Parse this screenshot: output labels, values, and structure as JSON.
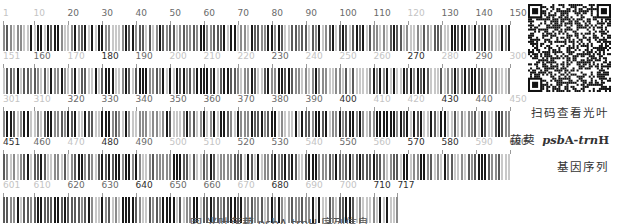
{
  "figure": {
    "sequence_length": 717,
    "rows": [
      {
        "start": 1,
        "end": 150,
        "labels": [
          {
            "t": "1",
            "tone": "l",
            "p": 0
          },
          {
            "t": "10",
            "tone": "l",
            "p": 9
          },
          {
            "t": "20",
            "tone": "m",
            "p": 19
          },
          {
            "t": "30",
            "tone": "m",
            "p": 29
          },
          {
            "t": "40",
            "tone": "m",
            "p": 39
          },
          {
            "t": "50",
            "tone": "m",
            "p": 49
          },
          {
            "t": "60",
            "tone": "m",
            "p": 59
          },
          {
            "t": "70",
            "tone": "m",
            "p": 69
          },
          {
            "t": "80",
            "tone": "m",
            "p": 79
          },
          {
            "t": "90",
            "tone": "m",
            "p": 89
          },
          {
            "t": "100",
            "tone": "m",
            "p": 99
          },
          {
            "t": "110",
            "tone": "m",
            "p": 109
          },
          {
            "t": "120",
            "tone": "l",
            "p": 119
          },
          {
            "t": "130",
            "tone": "m",
            "p": 129
          },
          {
            "t": "140",
            "tone": "m",
            "p": 139
          },
          {
            "t": "150",
            "tone": "m",
            "p": 149
          }
        ]
      },
      {
        "start": 151,
        "end": 300,
        "labels": [
          {
            "t": "151",
            "tone": "l",
            "p": 0
          },
          {
            "t": "160",
            "tone": "m",
            "p": 9
          },
          {
            "t": "170",
            "tone": "l",
            "p": 19
          },
          {
            "t": "180",
            "tone": "d",
            "p": 29
          },
          {
            "t": "190",
            "tone": "m",
            "p": 39
          },
          {
            "t": "200",
            "tone": "l",
            "p": 49
          },
          {
            "t": "210",
            "tone": "l",
            "p": 59
          },
          {
            "t": "220",
            "tone": "l",
            "p": 69
          },
          {
            "t": "230",
            "tone": "m",
            "p": 79
          },
          {
            "t": "240",
            "tone": "l",
            "p": 89
          },
          {
            "t": "250",
            "tone": "l",
            "p": 99
          },
          {
            "t": "260",
            "tone": "l",
            "p": 109
          },
          {
            "t": "270",
            "tone": "d",
            "p": 119
          },
          {
            "t": "280",
            "tone": "l",
            "p": 129
          },
          {
            "t": "290",
            "tone": "m",
            "p": 139
          },
          {
            "t": "300",
            "tone": "l",
            "p": 149
          }
        ]
      },
      {
        "start": 301,
        "end": 450,
        "labels": [
          {
            "t": "301",
            "tone": "l",
            "p": 0
          },
          {
            "t": "310",
            "tone": "l",
            "p": 9
          },
          {
            "t": "320",
            "tone": "m",
            "p": 19
          },
          {
            "t": "330",
            "tone": "m",
            "p": 29
          },
          {
            "t": "340",
            "tone": "m",
            "p": 39
          },
          {
            "t": "350",
            "tone": "m",
            "p": 49
          },
          {
            "t": "360",
            "tone": "m",
            "p": 59
          },
          {
            "t": "370",
            "tone": "m",
            "p": 69
          },
          {
            "t": "380",
            "tone": "m",
            "p": 79
          },
          {
            "t": "390",
            "tone": "m",
            "p": 89
          },
          {
            "t": "400",
            "tone": "d",
            "p": 99
          },
          {
            "t": "410",
            "tone": "l",
            "p": 109
          },
          {
            "t": "420",
            "tone": "l",
            "p": 119
          },
          {
            "t": "430",
            "tone": "d",
            "p": 129
          },
          {
            "t": "440",
            "tone": "m",
            "p": 139
          },
          {
            "t": "450",
            "tone": "l",
            "p": 149
          }
        ]
      },
      {
        "start": 451,
        "end": 600,
        "labels": [
          {
            "t": "451",
            "tone": "d",
            "p": 0
          },
          {
            "t": "460",
            "tone": "m",
            "p": 9
          },
          {
            "t": "470",
            "tone": "l",
            "p": 19
          },
          {
            "t": "480",
            "tone": "d",
            "p": 29
          },
          {
            "t": "490",
            "tone": "m",
            "p": 39
          },
          {
            "t": "500",
            "tone": "l",
            "p": 49
          },
          {
            "t": "510",
            "tone": "l",
            "p": 59
          },
          {
            "t": "520",
            "tone": "m",
            "p": 69
          },
          {
            "t": "530",
            "tone": "m",
            "p": 79
          },
          {
            "t": "540",
            "tone": "l",
            "p": 89
          },
          {
            "t": "550",
            "tone": "m",
            "p": 99
          },
          {
            "t": "560",
            "tone": "l",
            "p": 109
          },
          {
            "t": "570",
            "tone": "d",
            "p": 119
          },
          {
            "t": "580",
            "tone": "d",
            "p": 129
          },
          {
            "t": "590",
            "tone": "l",
            "p": 139
          },
          {
            "t": "600",
            "tone": "m",
            "p": 149
          }
        ]
      },
      {
        "start": 601,
        "end": 717,
        "labels": [
          {
            "t": "601",
            "tone": "l",
            "p": 0
          },
          {
            "t": "610",
            "tone": "l",
            "p": 9
          },
          {
            "t": "620",
            "tone": "m",
            "p": 19
          },
          {
            "t": "630",
            "tone": "m",
            "p": 29
          },
          {
            "t": "640",
            "tone": "d",
            "p": 39
          },
          {
            "t": "650",
            "tone": "m",
            "p": 49
          },
          {
            "t": "660",
            "tone": "m",
            "p": 59
          },
          {
            "t": "670",
            "tone": "l",
            "p": 69
          },
          {
            "t": "680",
            "tone": "d",
            "p": 79
          },
          {
            "t": "690",
            "tone": "l",
            "p": 89
          },
          {
            "t": "700",
            "tone": "l",
            "p": 99
          },
          {
            "t": "710",
            "tone": "d",
            "p": 109
          },
          {
            "t": "717",
            "tone": "d",
            "p": 116
          }
        ]
      }
    ],
    "bar_colors": {
      "A": "#1a1a1a",
      "T": "#5a5a5a",
      "G": "#8c8c8c",
      "C": "#c8c8c8"
    },
    "qr_label": "QR code"
  },
  "side_text": {
    "line1": "扫码查看光叶",
    "line2_prefix": "菝葜 ",
    "line2_gene_italic_1": "psb",
    "line2_gene_1": "A-",
    "line2_gene_italic_2": "trn",
    "line2_gene_2": "H",
    "line3": "基因序列"
  },
  "caption": {
    "text": "图 光叶菝葜 psbA-trnH 序列信息"
  }
}
